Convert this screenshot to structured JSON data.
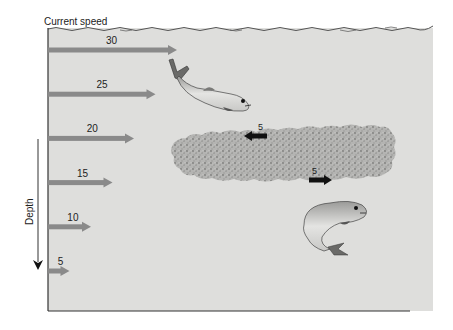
{
  "title": "Current speed",
  "depth_label": "Depth",
  "colors": {
    "water": "#dededc",
    "current_arrow": "#8a8a8a",
    "fish_arrow": "#111111",
    "plankton": "#a9a9a7",
    "axis": "#333333"
  },
  "current_arrows": [
    {
      "speed": "30",
      "value": 30
    },
    {
      "speed": "25",
      "value": 25
    },
    {
      "speed": "20",
      "value": 20
    },
    {
      "speed": "15",
      "value": 15
    },
    {
      "speed": "10",
      "value": 10
    },
    {
      "speed": "5",
      "value": 5
    }
  ],
  "plankton_layer": {
    "label": "plankton layer",
    "arrows": [
      {
        "speed": "5",
        "direction": "left"
      },
      {
        "speed": "5",
        "direction": "right"
      }
    ]
  },
  "fish": [
    {
      "name": "upper fish",
      "pose": "swimming right"
    },
    {
      "name": "lower fish",
      "pose": "curved, swimming right"
    }
  ]
}
